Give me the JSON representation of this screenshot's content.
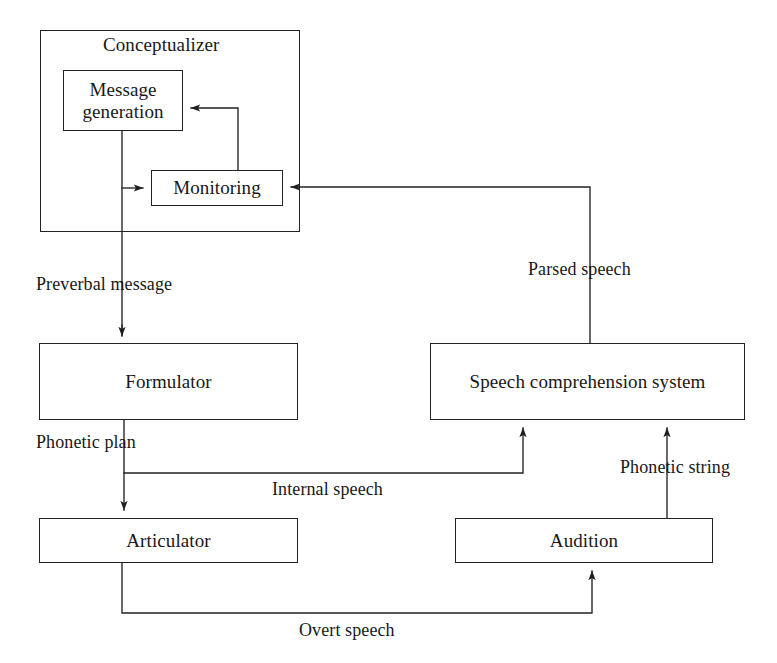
{
  "figure": {
    "type": "block-flow-diagram",
    "background_color": "#ffffff",
    "line_color": "#222222",
    "text_color": "#181818"
  },
  "groups": [
    {
      "id": "conceptualizer",
      "label": "Conceptualizer",
      "x": 40,
      "y": 30,
      "width": 260,
      "height": 202
    }
  ],
  "nodes": [
    {
      "id": "message-generation",
      "label": "Message\ngeneration",
      "x": 63,
      "y": 70,
      "width": 120,
      "height": 61
    },
    {
      "id": "monitoring",
      "label": "Monitoring",
      "x": 151,
      "y": 170,
      "width": 132,
      "height": 36
    },
    {
      "id": "formulator",
      "label": "Formulator",
      "x": 39,
      "y": 343,
      "width": 259,
      "height": 77
    },
    {
      "id": "speech-comprehension-system",
      "label": "Speech comprehension system",
      "x": 430,
      "y": 343,
      "width": 315,
      "height": 77
    },
    {
      "id": "articulator",
      "label": "Articulator",
      "x": 39,
      "y": 518,
      "width": 259,
      "height": 45
    },
    {
      "id": "audition",
      "label": "Audition",
      "x": 455,
      "y": 518,
      "width": 258,
      "height": 45
    }
  ],
  "edges": [
    {
      "id": "edge-monitoring-to-message-generation",
      "from": "monitoring",
      "to": "message-generation",
      "label": ""
    },
    {
      "id": "edge-message-generation-to-monitoring",
      "from": "message-generation",
      "to": "monitoring",
      "label": ""
    },
    {
      "id": "edge-preverbal-message",
      "from": "message-generation",
      "to": "formulator",
      "label": "Preverbal message",
      "label_x": 36,
      "label_y": 274
    },
    {
      "id": "edge-phonetic-plan",
      "from": "formulator",
      "to": "articulator",
      "label": "Phonetic plan",
      "label_x": 36,
      "label_y": 432
    },
    {
      "id": "edge-internal-speech",
      "from": "formulator",
      "to": "speech-comprehension-system",
      "label": "Internal speech",
      "label_x": 272,
      "label_y": 479
    },
    {
      "id": "edge-phonetic-string",
      "from": "audition",
      "to": "speech-comprehension-system",
      "label": "Phonetic string",
      "label_x": 620,
      "label_y": 457
    },
    {
      "id": "edge-parsed-speech",
      "from": "speech-comprehension-system",
      "to": "monitoring",
      "label": "Parsed speech",
      "label_x": 528,
      "label_y": 259
    },
    {
      "id": "edge-overt-speech",
      "from": "articulator",
      "to": "audition",
      "label": "Overt speech",
      "label_x": 299,
      "label_y": 620
    }
  ]
}
